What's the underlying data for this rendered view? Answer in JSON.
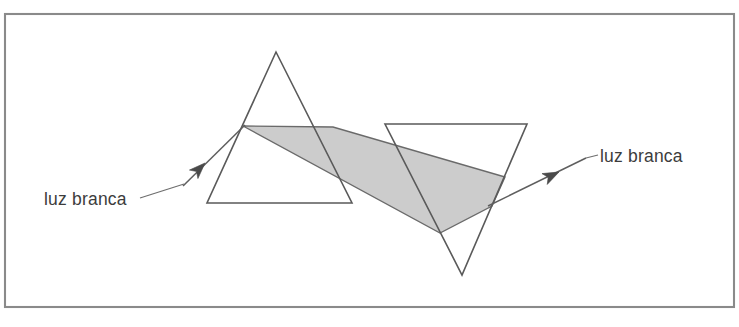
{
  "figure": {
    "colors": {
      "background": "#ffffff",
      "frame_stroke": "#8a8a8a",
      "outline_stroke": "#5a5a5a",
      "beam_fill": "#cccccc",
      "beam_stroke": "#6a6a6a",
      "arrow_fill": "#4a4a4a",
      "text": "#3c3c3c"
    },
    "frame": {
      "name": "figure-border",
      "x": 5,
      "y": 14,
      "width": 729,
      "height": 293
    },
    "labels": [
      {
        "id": "label-left",
        "text": "luz branca",
        "x": 44,
        "y": 205,
        "anchor": "start"
      },
      {
        "id": "label-right",
        "text": "luz branca",
        "x": 600,
        "y": 162,
        "anchor": "start"
      }
    ],
    "prisms": [
      {
        "id": "prism-left",
        "orientation": "apex-up",
        "points": "276,52 352,203 207,203"
      },
      {
        "id": "prism-right",
        "orientation": "apex-down",
        "points": "385,124 527,124 462,275"
      }
    ],
    "beam": {
      "id": "dispersed-beam",
      "fill": "#cccccc",
      "points": "243,126 333,127 505,177 492,206 440,233"
    },
    "rays": [
      {
        "id": "incident-ray",
        "from": {
          "x": 183,
          "y": 186
        },
        "to": {
          "x": 245,
          "y": 125
        },
        "arrow_at": {
          "x": 205,
          "y": 163
        },
        "arrow_angle_deg": -45
      },
      {
        "id": "emergent-ray",
        "from": {
          "x": 488,
          "y": 206
        },
        "to": {
          "x": 586,
          "y": 158
        },
        "arrow_at": {
          "x": 559,
          "y": 172
        },
        "arrow_angle_deg": -26
      }
    ],
    "leaders": [
      {
        "id": "leader-left",
        "from": {
          "x": 140,
          "y": 198
        },
        "to": {
          "x": 184,
          "y": 184
        }
      },
      {
        "id": "leader-right",
        "from": {
          "x": 586,
          "y": 158
        },
        "to": {
          "x": 598,
          "y": 155
        }
      }
    ]
  }
}
